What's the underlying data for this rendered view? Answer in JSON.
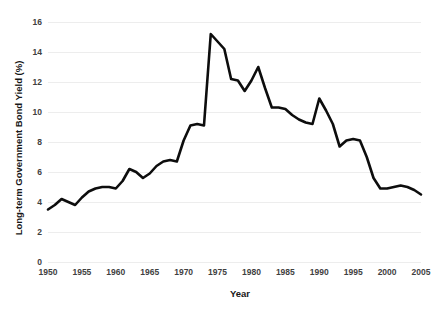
{
  "chart_data": {
    "type": "line",
    "title": "",
    "xlabel": "Year",
    "ylabel": "Long-term Government Bond Yield (%)",
    "xlim": [
      1950,
      2005
    ],
    "ylim": [
      0,
      16
    ],
    "grid": true,
    "legend": "none",
    "xticks": [
      1950,
      1955,
      1960,
      1965,
      1970,
      1975,
      1980,
      1985,
      1990,
      1995,
      2000,
      2005
    ],
    "yticks": [
      0,
      2,
      4,
      6,
      8,
      10,
      12,
      14,
      16
    ],
    "line_color": "#0d0d0d",
    "grid_color": "#ededed",
    "series": [
      {
        "name": "Long-term Government Bond Yield",
        "x": [
          1950,
          1951,
          1952,
          1953,
          1954,
          1955,
          1956,
          1957,
          1958,
          1959,
          1960,
          1961,
          1962,
          1963,
          1964,
          1965,
          1966,
          1967,
          1968,
          1969,
          1970,
          1971,
          1972,
          1973,
          1974,
          1975,
          1976,
          1977,
          1978,
          1979,
          1980,
          1981,
          1982,
          1983,
          1984,
          1985,
          1986,
          1987,
          1988,
          1989,
          1990,
          1991,
          1992,
          1993,
          1994,
          1995,
          1996,
          1997,
          1998,
          1999,
          2000,
          2001,
          2002,
          2003,
          2004,
          2005
        ],
        "values": [
          3.5,
          3.8,
          4.2,
          4.0,
          3.8,
          4.3,
          4.7,
          4.9,
          5.0,
          5.0,
          4.9,
          5.4,
          6.2,
          6.0,
          5.6,
          5.9,
          6.4,
          6.7,
          6.8,
          6.7,
          8.1,
          9.1,
          9.2,
          9.1,
          15.2,
          14.7,
          14.2,
          12.2,
          12.1,
          11.4,
          12.1,
          13.0,
          11.6,
          10.3,
          10.3,
          10.2,
          9.8,
          9.5,
          9.3,
          9.2,
          10.9,
          10.1,
          9.2,
          7.7,
          8.1,
          8.2,
          8.1,
          7.0,
          5.6,
          4.9,
          4.9,
          5.0,
          5.1,
          5.0,
          4.8,
          4.5
        ]
      }
    ]
  },
  "axes": {
    "y_tick_labels": [
      "16",
      "14",
      "12",
      "10",
      "8",
      "6",
      "4",
      "2",
      "0"
    ],
    "x_tick_labels": [
      "1950",
      "1955",
      "1960",
      "1965",
      "1970",
      "1975",
      "1980",
      "1985",
      "1990",
      "1995",
      "2000",
      "2005"
    ],
    "x_axis_title": "Year",
    "y_axis_title": "Long-term Government Bond Yield (%)"
  }
}
